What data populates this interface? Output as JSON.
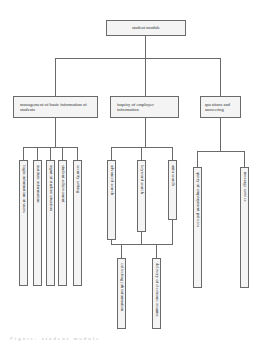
{
  "diagram": {
    "type": "hierarchy",
    "root": {
      "label": "student module"
    },
    "branches": [
      {
        "label": "management of basic information of students",
        "children": [
          "login information of users",
          "institute information",
          "input of student situation",
          "student achievement",
          "security setting"
        ]
      },
      {
        "label": "inquiry of employer information",
        "children": [
          "advanced search",
          "keyword search",
          "auto search"
        ],
        "sub_children": [
          "collecting job information",
          "delivery of electronic resume"
        ]
      },
      {
        "label": "questions and answering",
        "children": [
          "query of employment policies",
          "message service"
        ]
      }
    ],
    "caption": "Figure: student module"
  },
  "colors": {
    "box_fill": "#f4f4f4",
    "border": "#6a6a6a",
    "line": "#6a6a6a"
  }
}
